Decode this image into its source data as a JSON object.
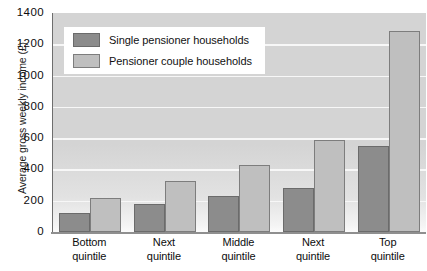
{
  "chart_data": {
    "type": "bar",
    "title": "",
    "xlabel": "",
    "ylabel": "Average gross weekly income (£)",
    "ylim": [
      0,
      1400
    ],
    "ytick_step": 200,
    "yticks": [
      "1400",
      "1200",
      "1000",
      "800",
      "600",
      "400",
      "200",
      "0"
    ],
    "grid": true,
    "legend_position": "top-left",
    "categories": [
      [
        "Bottom",
        "quintile"
      ],
      [
        "Next",
        "quintile"
      ],
      [
        "Middle",
        "quintile"
      ],
      [
        "Next",
        "quintile"
      ],
      [
        "Top",
        "quintile"
      ]
    ],
    "series": [
      {
        "name": "Single pensioner households",
        "color": "#8c8c8c",
        "values": [
          120,
          180,
          230,
          280,
          550
        ]
      },
      {
        "name": "Pensioner couple households",
        "color": "#bfbfbf",
        "values": [
          220,
          325,
          430,
          590,
          1285
        ]
      }
    ]
  },
  "legend": {
    "items": [
      {
        "label": "Single pensioner households",
        "key": "single"
      },
      {
        "label": "Pensioner couple households",
        "key": "couple"
      }
    ]
  },
  "colors": {
    "plot_background": "#d4d4d4",
    "gridline": "#f7f7f7",
    "axis": "#6e6e6e",
    "single_bar": "#8c8c8c",
    "couple_bar": "#bfbfbf",
    "text": "#0d0d0d"
  }
}
